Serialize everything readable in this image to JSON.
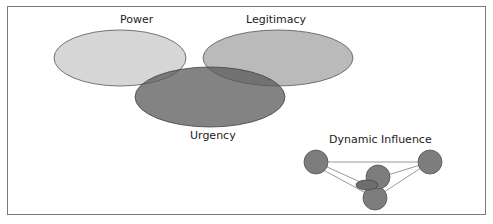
{
  "diagram": {
    "type": "venn",
    "sets": [
      {
        "label": "Power",
        "color": "#cfcfcf"
      },
      {
        "label": "Legitimacy",
        "color": "#b3b3b3"
      },
      {
        "label": "Urgency",
        "color": "#6e6e6e"
      }
    ],
    "inset": {
      "title": "Dynamic Influence",
      "node_color": "#7d7d7d",
      "node_count": 5
    }
  }
}
